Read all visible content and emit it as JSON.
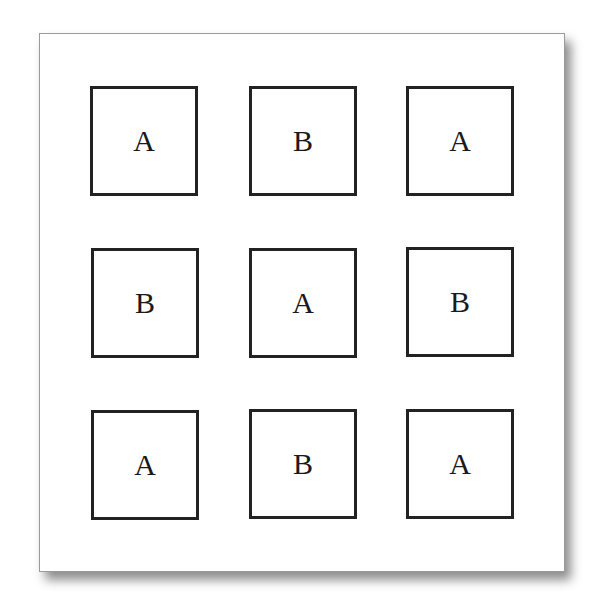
{
  "figure": {
    "grid": {
      "rows": 3,
      "cols": 3,
      "cells": [
        {
          "label": "A"
        },
        {
          "label": "B"
        },
        {
          "label": "A"
        },
        {
          "label": "B"
        },
        {
          "label": "A"
        },
        {
          "label": "B"
        },
        {
          "label": "A"
        },
        {
          "label": "B"
        },
        {
          "label": "A"
        }
      ]
    }
  }
}
